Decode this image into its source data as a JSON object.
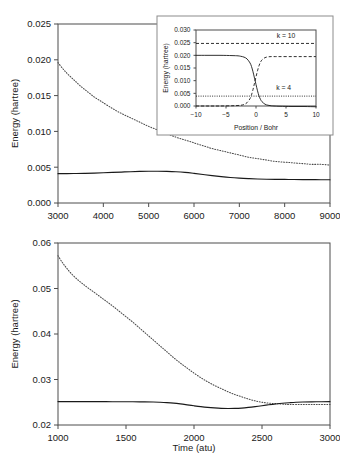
{
  "figure": {
    "title": "",
    "background": "#ffffff"
  },
  "chart_data": [
    {
      "id": "top-panel",
      "type": "line",
      "title": "",
      "xlabel": "",
      "ylabel": "Energy (hartree)",
      "xlim": [
        3000,
        9000
      ],
      "ylim": [
        0.0,
        0.025
      ],
      "xticks": [
        3000,
        4000,
        5000,
        6000,
        7000,
        8000,
        9000
      ],
      "xticklabels": [
        "3000",
        "4000",
        "5000",
        "6000",
        "7000",
        "8000",
        "9000"
      ],
      "yticks": [
        0.0,
        0.005,
        0.01,
        0.015,
        0.02,
        0.025
      ],
      "yticklabels": [
        "0.000",
        "0.005",
        "0.010",
        "0.015",
        "0.020",
        "0.025"
      ],
      "grid": false,
      "legend": "none",
      "series": [
        {
          "name": "dotted-decay",
          "style": "dotted",
          "x": [
            3000,
            3100,
            3200,
            3300,
            3400,
            3500,
            3600,
            3700,
            3800,
            3900,
            4000,
            4200,
            4400,
            4600,
            4800,
            5000,
            5200,
            5400,
            5600,
            5800,
            6000,
            6200,
            6400,
            6600,
            6800,
            7000,
            7200,
            7400,
            7600,
            7800,
            8000,
            8200,
            8400,
            8600,
            8800,
            9000
          ],
          "values": [
            0.0196,
            0.0188,
            0.0181,
            0.0175,
            0.0169,
            0.0163,
            0.0158,
            0.0153,
            0.0148,
            0.0144,
            0.014,
            0.0132,
            0.0125,
            0.0119,
            0.0113,
            0.0107,
            0.0102,
            0.0097,
            0.0092,
            0.0088,
            0.0084,
            0.008,
            0.0076,
            0.0073,
            0.007,
            0.0067,
            0.0064,
            0.0062,
            0.006,
            0.0058,
            0.0057,
            0.0056,
            0.0055,
            0.0054,
            0.0054,
            0.0053
          ]
        },
        {
          "name": "solid-flat",
          "style": "solid",
          "x": [
            3000,
            3200,
            3400,
            3600,
            3800,
            4000,
            4200,
            4400,
            4600,
            4800,
            5000,
            5200,
            5400,
            5600,
            5800,
            6000,
            6200,
            6400,
            6600,
            6800,
            7000,
            7200,
            7400,
            7600,
            7800,
            8000,
            8200,
            8400,
            8600,
            8800,
            9000
          ],
          "values": [
            0.0041,
            0.0041,
            0.00412,
            0.00414,
            0.00418,
            0.00422,
            0.00427,
            0.00432,
            0.00437,
            0.00441,
            0.00443,
            0.00444,
            0.00442,
            0.00437,
            0.00428,
            0.00414,
            0.00398,
            0.00382,
            0.00368,
            0.00356,
            0.00347,
            0.0034,
            0.00335,
            0.00332,
            0.0033,
            0.00329,
            0.00328,
            0.00327,
            0.00326,
            0.00325,
            0.00324
          ]
        }
      ]
    },
    {
      "id": "inset-panel",
      "type": "line",
      "title": "",
      "xlabel": "Position  / Bohr",
      "ylabel": "Energy (hartree)",
      "xlim": [
        -10,
        10
      ],
      "ylim": [
        0.0,
        0.03
      ],
      "xticks": [
        -10,
        -5,
        0,
        5,
        10
      ],
      "xticklabels": [
        "−10",
        "−5",
        "0",
        "5",
        "10"
      ],
      "yticks": [
        0.0,
        0.005,
        0.01,
        0.015,
        0.02,
        0.025,
        0.03
      ],
      "yticklabels": [
        "0.000",
        "0.005",
        "0.010",
        "0.015",
        "0.020",
        "0.025",
        "0.030"
      ],
      "grid": false,
      "legend": "none",
      "annotations": [
        {
          "text": "k = 10",
          "x": 5.0,
          "y": 0.0268
        },
        {
          "text": "k = 4",
          "x": 4.6,
          "y": 0.0063
        }
      ],
      "series": [
        {
          "name": "k10-constant",
          "style": "dashed",
          "x": [
            -10,
            10
          ],
          "values": [
            0.0247,
            0.0247
          ]
        },
        {
          "name": "k4-constant",
          "style": "dotted",
          "x": [
            -10,
            10
          ],
          "values": [
            0.0039,
            0.0039
          ]
        },
        {
          "name": "adiabatic-descending",
          "style": "solid",
          "x": [
            -10,
            -8,
            -6,
            -4,
            -3,
            -2.5,
            -2,
            -1.5,
            -1,
            -0.75,
            -0.5,
            -0.25,
            0,
            0.25,
            0.5,
            0.75,
            1,
            1.5,
            2,
            2.5,
            3,
            4,
            6,
            8,
            10
          ],
          "values": [
            0.02,
            0.02,
            0.02,
            0.0199,
            0.0198,
            0.0196,
            0.0193,
            0.0186,
            0.017,
            0.0156,
            0.0135,
            0.011,
            0.0085,
            0.006,
            0.004,
            0.0026,
            0.0017,
            0.0007,
            0.0003,
            0.0001,
            0.0,
            -0.0001,
            -0.0002,
            -0.0002,
            -0.0003
          ]
        },
        {
          "name": "adiabatic-ascending",
          "style": "dashed",
          "x": [
            -10,
            -8,
            -6,
            -4,
            -3,
            -2.5,
            -2,
            -1.5,
            -1,
            -0.75,
            -0.5,
            -0.25,
            0,
            0.25,
            0.5,
            0.75,
            1,
            1.5,
            2,
            2.5,
            3,
            4,
            6,
            8,
            10
          ],
          "values": [
            0.0,
            0.0,
            0.0,
            0.0001,
            0.0002,
            0.0003,
            0.0006,
            0.0013,
            0.0029,
            0.0044,
            0.0065,
            0.009,
            0.0115,
            0.0139,
            0.0159,
            0.0173,
            0.0182,
            0.0191,
            0.0194,
            0.0195,
            0.0195,
            0.0195,
            0.0195,
            0.0195,
            0.0195
          ]
        }
      ]
    },
    {
      "id": "bottom-panel",
      "type": "line",
      "title": "",
      "xlabel": "Time (atu)",
      "ylabel": "Energy (hartree)",
      "xlim": [
        1000,
        3000
      ],
      "ylim": [
        0.02,
        0.06
      ],
      "xticks": [
        1000,
        1500,
        2000,
        2500,
        3000
      ],
      "xticklabels": [
        "1000",
        "1500",
        "2000",
        "2500",
        "3000"
      ],
      "yticks": [
        0.02,
        0.03,
        0.04,
        0.05,
        0.06
      ],
      "yticklabels": [
        "0.02",
        "0.03",
        "0.04",
        "0.05",
        "0.06"
      ],
      "grid": false,
      "legend": "none",
      "series": [
        {
          "name": "dotted-decay",
          "style": "dotted",
          "x": [
            1000,
            1030,
            1060,
            1100,
            1150,
            1200,
            1250,
            1300,
            1350,
            1400,
            1450,
            1500,
            1550,
            1600,
            1650,
            1700,
            1750,
            1800,
            1850,
            1900,
            1950,
            2000,
            2050,
            2100,
            2150,
            2200,
            2250,
            2300,
            2350,
            2400,
            2450,
            2500,
            2550,
            2600,
            2650,
            2700,
            2800,
            2900,
            3000
          ],
          "values": [
            0.0572,
            0.0558,
            0.0546,
            0.0532,
            0.0518,
            0.0506,
            0.0495,
            0.0484,
            0.0473,
            0.0462,
            0.045,
            0.0438,
            0.0426,
            0.0413,
            0.04,
            0.0387,
            0.0374,
            0.0361,
            0.0348,
            0.0336,
            0.0325,
            0.0314,
            0.0304,
            0.0295,
            0.0287,
            0.028,
            0.0273,
            0.0267,
            0.0262,
            0.0257,
            0.0253,
            0.025,
            0.0248,
            0.0247,
            0.0246,
            0.0245,
            0.0245,
            0.0245,
            0.0245
          ]
        },
        {
          "name": "solid-flat",
          "style": "solid",
          "x": [
            1000,
            1100,
            1200,
            1300,
            1400,
            1500,
            1600,
            1700,
            1750,
            1800,
            1850,
            1900,
            1950,
            2000,
            2050,
            2100,
            2150,
            2200,
            2250,
            2300,
            2350,
            2400,
            2450,
            2500,
            2550,
            2600,
            2650,
            2700,
            2750,
            2800,
            2900,
            3000
          ],
          "values": [
            0.02515,
            0.02515,
            0.02514,
            0.02513,
            0.02512,
            0.02511,
            0.02509,
            0.02505,
            0.025,
            0.02492,
            0.0248,
            0.02463,
            0.02443,
            0.02422,
            0.02403,
            0.02387,
            0.02375,
            0.02366,
            0.02362,
            0.02364,
            0.02372,
            0.02386,
            0.02404,
            0.02424,
            0.02444,
            0.02462,
            0.02478,
            0.0249,
            0.025,
            0.02506,
            0.02511,
            0.02513
          ]
        }
      ]
    }
  ]
}
